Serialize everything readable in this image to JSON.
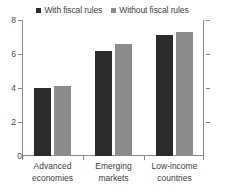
{
  "legend": {
    "entries": [
      {
        "label": "With fiscal rules",
        "color": "#2b2b2b",
        "icon": "square-swatch"
      },
      {
        "label": "Without fiscal rules",
        "color": "#8c8c8c",
        "icon": "square-swatch"
      }
    ]
  },
  "yaxis": {
    "ticks": [
      "0",
      "2",
      "4",
      "6",
      "8"
    ]
  },
  "xaxis": {
    "categories": [
      {
        "line1": "Advanced",
        "line2": "economies"
      },
      {
        "line1": "Emerging",
        "line2": "markets"
      },
      {
        "line1": "Low-income",
        "line2": "countries"
      }
    ]
  },
  "chart_data": {
    "type": "bar",
    "title": "",
    "xlabel": "",
    "ylabel": "",
    "categories": [
      "Advanced economies",
      "Emerging markets",
      "Low-income countries"
    ],
    "series": [
      {
        "name": "With fiscal rules",
        "color": "#2b2b2b",
        "values": [
          4.0,
          6.2,
          7.1
        ]
      },
      {
        "name": "Without fiscal rules",
        "color": "#8c8c8c",
        "values": [
          4.1,
          6.6,
          7.3
        ]
      }
    ],
    "ylim": [
      0,
      8
    ],
    "yticks": [
      0,
      2,
      4,
      6,
      8
    ],
    "grid": false,
    "legend_position": "top",
    "axis_color": "#8a8a8a",
    "background": "#ffffff"
  }
}
